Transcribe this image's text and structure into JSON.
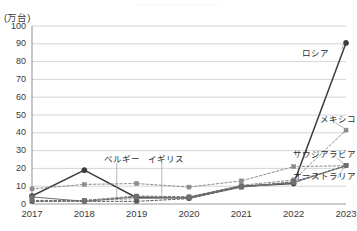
{
  "figure": {
    "top_cut_title": "⋯⋯⋯⋯⋯⋯⋯⋯⋯⋯⋯⋯",
    "unit_label": "(万台)"
  },
  "chart_data": {
    "type": "line",
    "title": "",
    "xlabel": "",
    "ylabel": "(万台)",
    "unit": "万台",
    "grid": true,
    "legend_position": "inline-annotations",
    "categories": [
      "2017",
      "2018",
      "2019",
      "2020",
      "2021",
      "2022",
      "2023"
    ],
    "x": [
      2017,
      2018,
      2019,
      2020,
      2021,
      2022,
      2023
    ],
    "ylim": [
      0,
      100
    ],
    "yticks": [
      0,
      10,
      20,
      30,
      40,
      50,
      60,
      70,
      80,
      90,
      100
    ],
    "xlim": [
      2017,
      2023
    ],
    "series": [
      {
        "name": "ロシア",
        "label": "ロシア",
        "color": "#3c3c3c",
        "marker": "circle",
        "line_style": "solid",
        "values": [
          4.5,
          19.0,
          3.5,
          3.5,
          10.0,
          11.5,
          90.5
        ]
      },
      {
        "name": "メキシコ",
        "label": "メキシコ",
        "color": "#8c8c8c",
        "marker": "square",
        "line_style": "dashed",
        "values": [
          1.5,
          2.0,
          3.0,
          4.0,
          10.5,
          13.5,
          41.5
        ]
      },
      {
        "name": "サウジアラビア",
        "label": "サウジアラビア",
        "color": "#8c8c8c",
        "marker": "square",
        "line_style": "dashed",
        "values": [
          8.5,
          11.0,
          11.5,
          9.5,
          13.0,
          21.0,
          21.5
        ]
      },
      {
        "name": "ベルギー",
        "label": "ベルギー",
        "color": "#5a5a5a",
        "marker": "square",
        "line_style": "dashed",
        "values": [
          1.5,
          1.5,
          1.5,
          3.0,
          9.5,
          12.5,
          21.5
        ]
      },
      {
        "name": "イギリス",
        "label": "イギリス",
        "color": "#6e6e6e",
        "marker": "square",
        "line_style": "dashed",
        "values": [
          2.0,
          2.0,
          4.5,
          4.0,
          10.0,
          12.0,
          21.5
        ]
      },
      {
        "name": "オーストラリア",
        "label": "オーストラリア",
        "color": "#707070",
        "marker": "square",
        "line_style": "solid",
        "values": [
          4.0,
          1.5,
          4.0,
          3.5,
          9.5,
          12.0,
          21.5
        ]
      }
    ],
    "annotations": [
      {
        "text": "ロシア",
        "x": 2022.15,
        "y": 84.0
      },
      {
        "text": "メキシコ",
        "x": 2022.62,
        "y": 47.0
      },
      {
        "text": "サウジアラビア",
        "x": 2022.52,
        "y": 27.5
      },
      {
        "text": "オーストラリア",
        "x": 2022.58,
        "y": 15.0
      },
      {
        "text": "ベルギー",
        "x": 2018.38,
        "y": 25.0
      },
      {
        "text": "イギリス",
        "x": 2019.22,
        "y": 25.0
      }
    ]
  }
}
